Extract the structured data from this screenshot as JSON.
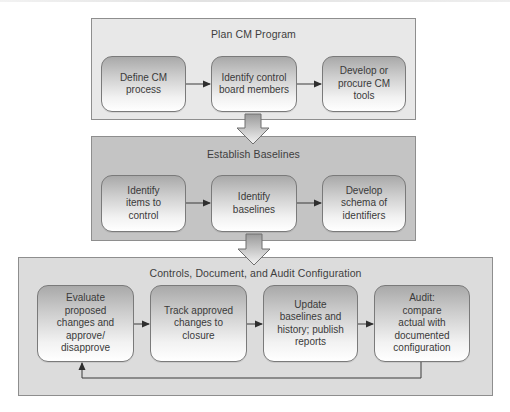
{
  "diagram": {
    "phases": [
      {
        "title": "Plan CM Program",
        "steps": [
          "Define CM\nprocess",
          "Identify control\nboard members",
          "Develop or\nprocure CM\ntools"
        ]
      },
      {
        "title": "Establish Baselines",
        "steps": [
          "Identify\nitems to\ncontrol",
          "Identify\nbaselines",
          "Develop\nschema of\nidentifiers"
        ]
      },
      {
        "title": "Controls, Document, and Audit Configuration",
        "steps": [
          "Evaluate\nproposed\nchanges and\napprove/\ndisapprove",
          "Track approved\nchanges to\nclosure",
          "Update\nbaselines and\nhistory; publish\nreports",
          "Audit:\ncompare\nactual with\ndocumented\nconfiguration"
        ]
      }
    ],
    "connections": [
      {
        "from": "Define CM process",
        "to": "Identify control board members",
        "type": "arrow"
      },
      {
        "from": "Identify control board members",
        "to": "Develop or procure CM tools",
        "type": "arrow"
      },
      {
        "from": "Plan CM Program",
        "to": "Establish Baselines",
        "type": "block-arrow"
      },
      {
        "from": "Identify items to control",
        "to": "Identify baselines",
        "type": "arrow"
      },
      {
        "from": "Identify baselines",
        "to": "Develop schema of identifiers",
        "type": "arrow"
      },
      {
        "from": "Establish Baselines",
        "to": "Controls, Document, and Audit Configuration",
        "type": "block-arrow"
      },
      {
        "from": "Evaluate proposed changes and approve/disapprove",
        "to": "Track approved changes to closure",
        "type": "arrow"
      },
      {
        "from": "Track approved changes to closure",
        "to": "Update baselines and history; publish reports",
        "type": "arrow"
      },
      {
        "from": "Update baselines and history; publish reports",
        "to": "Audit: compare actual with documented configuration",
        "type": "arrow"
      },
      {
        "from": "Audit: compare actual with documented configuration",
        "to": "Evaluate proposed changes and approve/disapprove",
        "type": "feedback-loop"
      }
    ],
    "colors": {
      "phase_light": "#e8e8e8",
      "phase_dark": "#c4c4c4",
      "border": "#8e8e8e",
      "line": "#3a3a3a"
    }
  }
}
